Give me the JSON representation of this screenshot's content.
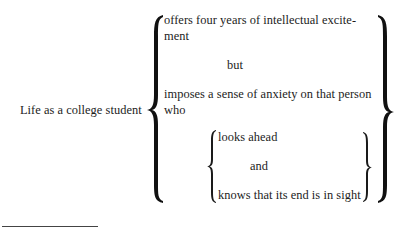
{
  "diagram": {
    "subject": "Life as a college student",
    "outer_group": {
      "line1a": "offers four years of intellectual excite-",
      "line1b": "ment",
      "connector": "but",
      "line2a": "imposes a sense of anxiety on that person",
      "line2b": "who"
    },
    "inner_group": {
      "line1": "looks ahead",
      "connector": "and",
      "line2": "knows that its end is in sight"
    }
  },
  "footnote_rule": true
}
